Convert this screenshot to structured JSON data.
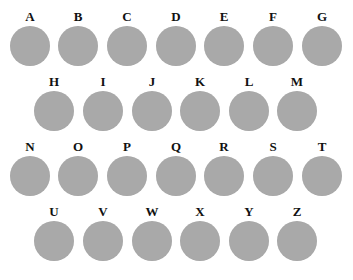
{
  "colors": {
    "background": "#ffffff",
    "circle_fill": "#a9a9a9",
    "label_color": "#111111"
  },
  "rows": [
    {
      "top": 10,
      "items": [
        {
          "label": "A",
          "cx": 30
        },
        {
          "label": "B",
          "cx": 78
        },
        {
          "label": "C",
          "cx": 127
        },
        {
          "label": "D",
          "cx": 176
        },
        {
          "label": "E",
          "cx": 224
        },
        {
          "label": "F",
          "cx": 273
        },
        {
          "label": "G",
          "cx": 322
        }
      ]
    },
    {
      "top": 75,
      "items": [
        {
          "label": "H",
          "cx": 54
        },
        {
          "label": "I",
          "cx": 103
        },
        {
          "label": "J",
          "cx": 152
        },
        {
          "label": "K",
          "cx": 200
        },
        {
          "label": "L",
          "cx": 249
        },
        {
          "label": "M",
          "cx": 297
        }
      ]
    },
    {
      "top": 140,
      "items": [
        {
          "label": "N",
          "cx": 30
        },
        {
          "label": "O",
          "cx": 78
        },
        {
          "label": "P",
          "cx": 127
        },
        {
          "label": "Q",
          "cx": 176
        },
        {
          "label": "R",
          "cx": 224
        },
        {
          "label": "S",
          "cx": 273
        },
        {
          "label": "T",
          "cx": 322
        }
      ]
    },
    {
      "top": 205,
      "items": [
        {
          "label": "U",
          "cx": 54
        },
        {
          "label": "V",
          "cx": 103
        },
        {
          "label": "W",
          "cx": 152
        },
        {
          "label": "X",
          "cx": 200
        },
        {
          "label": "Y",
          "cx": 249
        },
        {
          "label": "Z",
          "cx": 297
        }
      ]
    }
  ]
}
